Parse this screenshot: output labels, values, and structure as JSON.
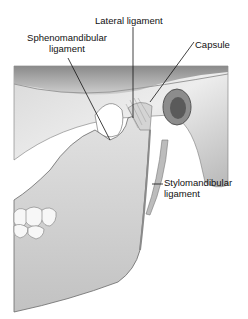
{
  "figure": {
    "labels": {
      "lateral_ligament": "Lateral ligament",
      "sphenomandibular_line1": "Sphenomandibular",
      "sphenomandibular_line2": "ligament",
      "capsule": "Capsule",
      "stylomandibular_line1": "Stylomandibular",
      "stylomandibular_line2": "ligament"
    },
    "colors": {
      "background": "#ffffff",
      "bone_light": "#e6e6e6",
      "bone_mid": "#bdbdbd",
      "bone_dark": "#6e6e6e",
      "leader_line": "#111111",
      "text": "#111111"
    }
  }
}
